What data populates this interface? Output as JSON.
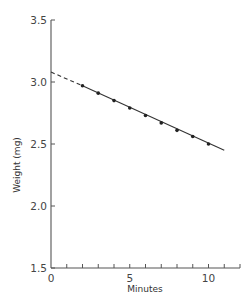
{
  "chart_data": {
    "type": "line",
    "title": "",
    "xlabel": "Minutes",
    "ylabel": "Weight (mg)",
    "xlim": [
      0,
      12
    ],
    "ylim": [
      1.5,
      3.5
    ],
    "x_ticks_labeled": [
      0,
      5,
      10
    ],
    "x_ticks_minor": [
      1,
      2,
      3,
      4,
      6,
      7,
      8,
      9,
      11,
      12
    ],
    "y_ticks": [
      1.5,
      2.0,
      2.5,
      3.0,
      3.5
    ],
    "y_tick_labels": [
      "1.5",
      "2.0",
      "2.5",
      "3.0",
      "3.5"
    ],
    "x_tick_labels": [
      "0",
      "5",
      "10"
    ],
    "grid": false,
    "legend": null,
    "series": [
      {
        "name": "measured",
        "style": "markers",
        "x": [
          2,
          3,
          4,
          5,
          6,
          7,
          8,
          9,
          10
        ],
        "values": [
          2.97,
          2.91,
          2.85,
          2.79,
          2.73,
          2.67,
          2.61,
          2.56,
          2.5
        ]
      },
      {
        "name": "fit (solid)",
        "style": "solid",
        "x": [
          2,
          11
        ],
        "values": [
          2.97,
          2.45
        ]
      },
      {
        "name": "extrapolation (dashed)",
        "style": "dashed",
        "x": [
          0,
          2
        ],
        "values": [
          3.08,
          2.97
        ]
      }
    ],
    "colors": {
      "line": "#333333",
      "marker": "#222222",
      "axis": "#555555"
    }
  }
}
